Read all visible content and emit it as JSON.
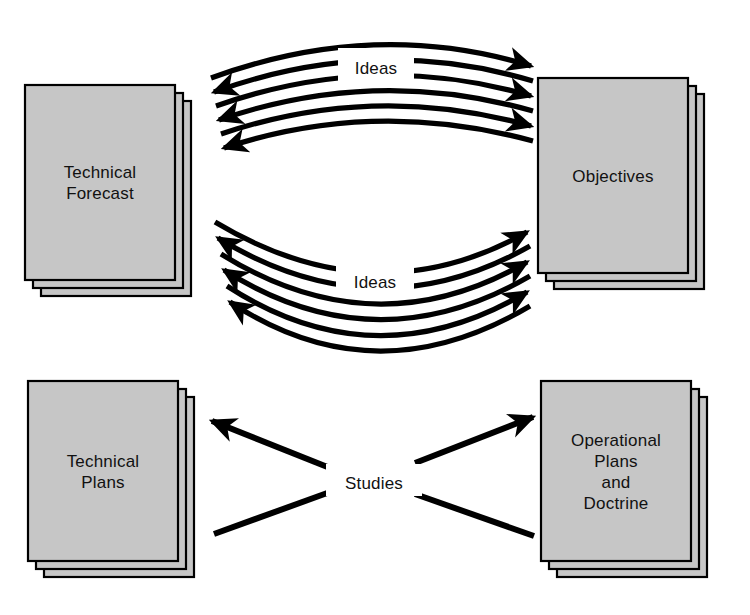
{
  "diagram": {
    "background_color": "#ffffff",
    "box_fill_color": "#c6c6c6",
    "line_color": "#000000",
    "width": 750,
    "height": 615
  },
  "boxes": [
    {
      "id": "technical-forecast",
      "lines": [
        "Technical",
        "Forecast"
      ],
      "line1": "Technical",
      "line2": "Forecast",
      "position": "top-left",
      "stack_count": 3
    },
    {
      "id": "objectives",
      "lines": [
        "Objectives"
      ],
      "line1": "Objectives",
      "position": "top-right",
      "stack_count": 3
    },
    {
      "id": "technical-plans",
      "lines": [
        "Technical",
        "Plans"
      ],
      "line1": "Technical",
      "line2": "Plans",
      "position": "bottom-left",
      "stack_count": 3
    },
    {
      "id": "operational-plans-and-doctrine",
      "lines": [
        "Operational",
        "Plans",
        "and",
        "Doctrine"
      ],
      "line1": "Operational",
      "line2": "Plans",
      "line3": "and",
      "line4": "Doctrine",
      "position": "bottom-right",
      "stack_count": 3
    }
  ],
  "flows": [
    {
      "id": "ideas-upper",
      "label": "Ideas",
      "from": "technical-forecast",
      "to": "objectives",
      "direction": "bidirectional",
      "arc_count": 6,
      "arrows_right": 3,
      "arrows_left": 3,
      "curvature": "arc-up"
    },
    {
      "id": "ideas-lower",
      "label": "Ideas",
      "from": "technical-forecast",
      "to": "objectives",
      "direction": "bidirectional",
      "arc_count": 6,
      "arrows_right": 3,
      "arrows_left": 3,
      "curvature": "arc-down"
    },
    {
      "id": "studies",
      "label": "Studies",
      "from": "studies-hub",
      "to": [
        "technical-plans",
        "operational-plans-and-doctrine"
      ],
      "direction": "crossing",
      "line_count": 4,
      "arrows": 2
    }
  ]
}
